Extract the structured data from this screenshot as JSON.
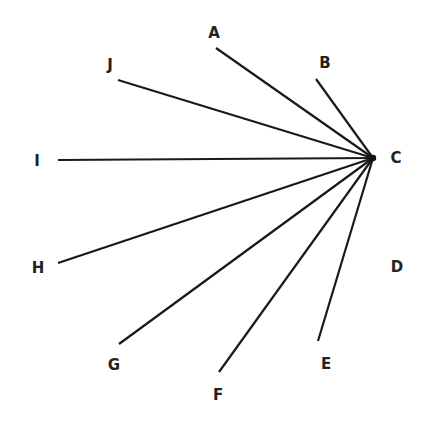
{
  "diagram": {
    "type": "radial-line-diagram",
    "colors": {
      "line": "#1a1a1a",
      "label": "#222222",
      "background": "#ffffff"
    },
    "hub": {
      "id": "C",
      "label": "C",
      "x": 373,
      "y": 158,
      "label_x": 396,
      "label_y": 158
    },
    "points": [
      {
        "id": "A",
        "label": "A",
        "x": 216,
        "y": 48,
        "label_x": 214,
        "label_y": 33,
        "connected": true
      },
      {
        "id": "B",
        "label": "B",
        "x": 316,
        "y": 79,
        "label_x": 325,
        "label_y": 63,
        "connected": true
      },
      {
        "id": "D",
        "label": "D",
        "x": 397,
        "y": 267,
        "label_x": 397,
        "label_y": 267,
        "connected": false
      },
      {
        "id": "E",
        "label": "E",
        "x": 318,
        "y": 341,
        "label_x": 326,
        "label_y": 364,
        "connected": true
      },
      {
        "id": "F",
        "label": "F",
        "x": 219,
        "y": 372,
        "label_x": 218,
        "label_y": 395,
        "connected": true
      },
      {
        "id": "G",
        "label": "G",
        "x": 119,
        "y": 344,
        "label_x": 114,
        "label_y": 365,
        "connected": true
      },
      {
        "id": "H",
        "label": "H",
        "x": 58,
        "y": 263,
        "label_x": 38,
        "label_y": 268,
        "connected": true
      },
      {
        "id": "I",
        "label": "I",
        "x": 58,
        "y": 160,
        "label_x": 37,
        "label_y": 161,
        "connected": true
      },
      {
        "id": "J",
        "label": "J",
        "x": 118,
        "y": 80,
        "label_x": 110,
        "label_y": 65,
        "connected": true
      }
    ]
  }
}
